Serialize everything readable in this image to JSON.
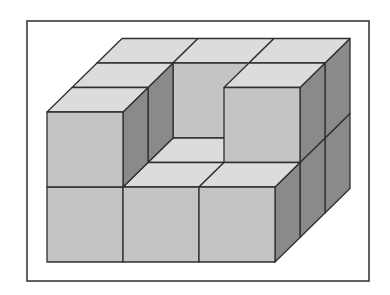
{
  "figure": {
    "frame": {
      "x": 27,
      "y": 21,
      "width": 342,
      "height": 260
    },
    "projection": {
      "origin_x": 47,
      "origin_y": 262,
      "unit_x": 76,
      "unit_y": 75,
      "depth_dx": 25,
      "depth_dy": 24.5
    },
    "colors": {
      "top": "#dcdcdc",
      "front": "#c4c4c4",
      "side": "#8a8a8a",
      "stroke": "#2f2f2f",
      "frame_stroke": "#3a3a3a"
    },
    "grid": {
      "columns": 3,
      "depth": 3,
      "layers": 2
    },
    "cubes": [
      {
        "x": 0,
        "y": 0,
        "z": 2
      },
      {
        "x": 1,
        "y": 0,
        "z": 2
      },
      {
        "x": 2,
        "y": 0,
        "z": 2
      },
      {
        "x": 0,
        "y": 0,
        "z": 1
      },
      {
        "x": 1,
        "y": 0,
        "z": 1
      },
      {
        "x": 2,
        "y": 0,
        "z": 1
      },
      {
        "x": 0,
        "y": 0,
        "z": 0
      },
      {
        "x": 1,
        "y": 0,
        "z": 0
      },
      {
        "x": 2,
        "y": 0,
        "z": 0
      },
      {
        "x": 0,
        "y": 1,
        "z": 2
      },
      {
        "x": 1,
        "y": 1,
        "z": 2
      },
      {
        "x": 2,
        "y": 1,
        "z": 2
      },
      {
        "x": 0,
        "y": 1,
        "z": 1
      },
      {
        "x": 2,
        "y": 1,
        "z": 1
      },
      {
        "x": 0,
        "y": 1,
        "z": 0
      }
    ],
    "total_cubes_visible": 15
  }
}
